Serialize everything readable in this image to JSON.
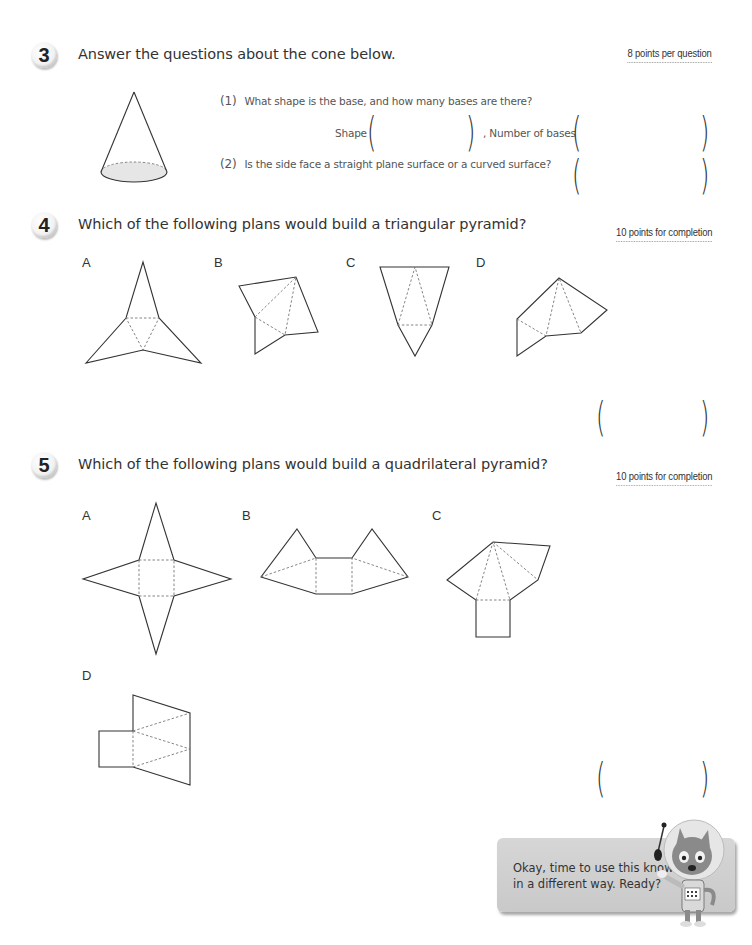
{
  "questions": [
    {
      "number": "3",
      "title": "Answer the questions about the cone below.",
      "points": "8 points per question",
      "subquestions": [
        {
          "number": "(1)",
          "text": "What shape is the base, and how many bases are there?",
          "answer_fields": [
            {
              "label": "Shape",
              "value": ""
            },
            {
              "label": ", Number of bases",
              "value": ""
            }
          ]
        },
        {
          "number": "(2)",
          "text": "Is the side face a straight plane surface or a curved surface?",
          "answer_fields": [
            {
              "label": "",
              "value": ""
            }
          ]
        }
      ],
      "figure": "cone-icon"
    },
    {
      "number": "4",
      "title": "Which of the following plans would build a triangular pyramid?",
      "points": "10 points for completion",
      "options": [
        {
          "label": "A"
        },
        {
          "label": "B"
        },
        {
          "label": "C"
        },
        {
          "label": "D"
        }
      ],
      "answer_value": ""
    },
    {
      "number": "5",
      "title": "Which of the following plans would build a quadrilateral pyramid?",
      "points": "10 points for completion",
      "options": [
        {
          "label": "A"
        },
        {
          "label": "B"
        },
        {
          "label": "C"
        },
        {
          "label": "D"
        }
      ],
      "answer_value": ""
    }
  ],
  "paren": {
    "open": "(",
    "close": ")"
  },
  "mascot": {
    "speech": "Okay, time to use this knowledge in a different way. Ready?",
    "icon": "astronaut-cat-icon"
  }
}
